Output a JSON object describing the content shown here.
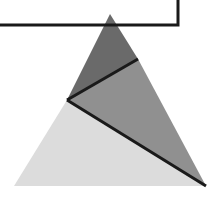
{
  "canvas": {
    "width": 219,
    "height": 200,
    "background_color": "#ffffff",
    "title": "Subdivided triangle with corner rule line"
  },
  "palette": {
    "dark_gray": "#6a6a6a",
    "medium_gray": "#909090",
    "light_gray": "#dcdcdc",
    "line_black": "#1a1a1a",
    "white": "#ffffff"
  },
  "figure": {
    "outer_triangle": {
      "name": "outer-triangle",
      "apex": [
        110,
        14
      ],
      "bottom_left": [
        14,
        186
      ],
      "bottom_right": [
        206,
        186
      ]
    },
    "interior_vertex": [
      67,
      100
    ],
    "right_edge_point": [
      138,
      59
    ],
    "regions": [
      {
        "id": "region-top",
        "label": "top-dark-region",
        "fill": "#6a6a6a",
        "points": "110,14 138,59 67,100"
      },
      {
        "id": "region-right",
        "label": "right-medium-region",
        "fill": "#909090",
        "points": "138,59 206,186 67,100"
      },
      {
        "id": "region-bottom-left",
        "label": "bottom-left-light-region",
        "fill": "#dcdcdc",
        "points": "67,100 206,186 14,186"
      }
    ],
    "divider_lines": [
      {
        "id": "divider-upper",
        "label": "upper-divider-line",
        "from": [
          67,
          100
        ],
        "to": [
          138,
          59
        ],
        "stroke": "#1a1a1a",
        "stroke_width": 3
      },
      {
        "id": "divider-lower",
        "label": "lower-divider-line",
        "from": [
          67,
          100
        ],
        "to": [
          206,
          186
        ],
        "stroke": "#1a1a1a",
        "stroke_width": 3
      }
    ],
    "rule_polyline": {
      "id": "corner-rule",
      "label": "corner-rule-polyline",
      "points": "0,25 178,25 178,0",
      "stroke": "#1a1a1a",
      "stroke_width": 3
    }
  }
}
